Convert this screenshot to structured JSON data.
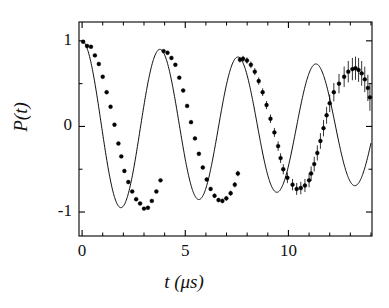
{
  "chart_data": {
    "type": "line",
    "title": "",
    "xlabel": "t (μs)",
    "ylabel": "P(t)",
    "xlim": [
      -0.15,
      14.05
    ],
    "ylim": [
      -1.28,
      1.22
    ],
    "xticks": [
      0,
      5,
      10
    ],
    "xtick_labels": [
      "0",
      "5",
      "10"
    ],
    "yticks": [
      1,
      0,
      -1
    ],
    "ytick_labels": [
      "1",
      "0",
      "-1"
    ],
    "grid": false,
    "legend": null,
    "series": [
      {
        "name": "fit",
        "style": "solid-line",
        "description": "exponentially damped cosine fit",
        "model": "P(t) = exp(-t/T2) * cos(2*pi*t/T)",
        "T_period_us": 3.78,
        "T2_decay_us": 36.0,
        "x": [
          0.0,
          0.2,
          0.4,
          0.6,
          0.8,
          1.0,
          1.2,
          1.4,
          1.6,
          1.8,
          2.0,
          2.2,
          2.4,
          2.6,
          2.8,
          3.0,
          3.2,
          3.4,
          3.6,
          3.8,
          4.0,
          4.2,
          4.4,
          4.6,
          4.8,
          5.0,
          5.2,
          5.4,
          5.6,
          5.8,
          6.0,
          6.2,
          6.4,
          6.6,
          6.8,
          7.0,
          7.2,
          7.4,
          7.6,
          7.8,
          8.0,
          8.2,
          8.4,
          8.6,
          8.8,
          9.0,
          9.2,
          9.4,
          9.6,
          9.8,
          10.0,
          10.2,
          10.4,
          10.6,
          10.8,
          11.0,
          11.2,
          11.4,
          11.6,
          11.8,
          12.0,
          12.2,
          12.4,
          12.6,
          12.8,
          13.0,
          13.2,
          13.4,
          13.6,
          13.8,
          14.0
        ],
        "y": [
          1.0,
          0.989,
          0.938,
          0.85,
          0.729,
          0.58,
          0.41,
          0.228,
          0.04,
          -0.146,
          -0.322,
          -0.48,
          -0.616,
          -0.724,
          -0.8,
          -0.843,
          -0.85,
          -0.823,
          -0.762,
          -0.671,
          -0.553,
          -0.414,
          -0.261,
          -0.101,
          0.061,
          0.218,
          0.364,
          0.494,
          0.602,
          0.684,
          0.738,
          0.762,
          0.755,
          0.718,
          0.653,
          0.562,
          0.45,
          0.322,
          0.184,
          0.041,
          -0.1,
          -0.234,
          -0.356,
          -0.46,
          -0.543,
          -0.601,
          -0.633,
          -0.638,
          -0.616,
          -0.568,
          -0.497,
          -0.405,
          -0.297,
          -0.178,
          -0.053,
          0.073,
          0.194,
          0.306,
          0.404,
          0.485,
          0.545,
          0.583,
          0.597,
          0.588,
          0.555,
          0.501,
          0.428,
          0.339,
          0.238,
          0.13,
          0.018
        ]
      },
      {
        "name": "measured data",
        "style": "markers-with-errorbars",
        "x": [
          0.05,
          0.24,
          0.43,
          0.62,
          0.81,
          1.0,
          1.19,
          1.38,
          1.57,
          1.76,
          1.9,
          2.05,
          2.24,
          2.43,
          2.62,
          2.81,
          3.0,
          3.19,
          3.38,
          3.6,
          3.8,
          3.95,
          4.14,
          4.33,
          4.52,
          4.71,
          4.9,
          5.09,
          5.28,
          5.47,
          5.66,
          5.85,
          6.04,
          6.23,
          6.42,
          6.61,
          6.8,
          6.99,
          7.2,
          7.4,
          7.55,
          7.65,
          7.8,
          7.99,
          8.18,
          8.37,
          8.56,
          8.75,
          8.94,
          9.13,
          9.32,
          9.5,
          9.62,
          9.75,
          9.95,
          10.2,
          10.4,
          10.6,
          10.8,
          11.0,
          11.1,
          11.25,
          11.4,
          11.55,
          11.7,
          11.85,
          12.0,
          12.2,
          12.45,
          12.7,
          12.9,
          13.1,
          13.25,
          13.4,
          13.55,
          13.7,
          13.85,
          13.95
        ],
        "y": [
          0.99,
          0.94,
          0.93,
          0.83,
          0.73,
          0.58,
          0.4,
          0.23,
          0.02,
          -0.2,
          -0.35,
          -0.52,
          -0.65,
          -0.76,
          -0.85,
          -0.9,
          -0.96,
          -0.95,
          -0.87,
          -0.76,
          -0.63,
          0.88,
          0.86,
          0.8,
          0.72,
          0.57,
          0.42,
          0.24,
          0.05,
          -0.14,
          -0.32,
          -0.48,
          -0.62,
          -0.73,
          -0.81,
          -0.86,
          -0.87,
          -0.84,
          -0.78,
          -0.68,
          -0.55,
          0.78,
          0.79,
          0.77,
          0.72,
          0.64,
          0.53,
          0.4,
          0.25,
          0.09,
          -0.07,
          -0.23,
          -0.37,
          -0.5,
          -0.6,
          -0.68,
          -0.73,
          -0.72,
          -0.69,
          -0.63,
          -0.55,
          -0.44,
          -0.31,
          -0.17,
          -0.02,
          0.13,
          0.27,
          0.4,
          0.5,
          0.58,
          0.64,
          0.67,
          0.68,
          0.66,
          0.62,
          0.55,
          0.45,
          0.34
        ],
        "yerr_low": 0.01,
        "yerr_high": 0.16,
        "note": "marker errorbars grow with t; nearly invisible below t~7 us"
      }
    ]
  },
  "figure": {
    "axis_line_color": "#000000",
    "marker_color": "#000000",
    "curve_color": "#000000",
    "background": "#ffffff",
    "marker_shape": "filled-circle"
  }
}
